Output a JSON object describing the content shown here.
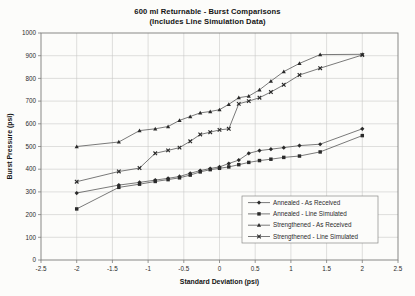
{
  "title": "600 ml Returnable - Burst Comparisons",
  "subtitle": "(Includes Line Simulation Data)",
  "chart_data": {
    "type": "line",
    "title": "600 ml Returnable - Burst Comparisons",
    "subtitle": "(Includes Line Simulation Data)",
    "xlabel": "Standard Deviation (psi)",
    "ylabel": "Burst Pressure (psi)",
    "xlim": [
      -2.5,
      2.5
    ],
    "ylim": [
      0,
      1000
    ],
    "xstep": 0.5,
    "ystep": 100,
    "grid": true,
    "legend_position": "inside-lower-right",
    "xticks": [
      "-2.5",
      "-2",
      "-1.5",
      "-1",
      "-0.5",
      "0",
      "0.5",
      "1",
      "1.5",
      "2",
      "2.5"
    ],
    "yticks": [
      "0",
      "100",
      "200",
      "300",
      "400",
      "500",
      "600",
      "700",
      "800",
      "900",
      "1000"
    ],
    "x": [
      -2.0,
      -1.41,
      -1.12,
      -0.9,
      -0.72,
      -0.56,
      -0.41,
      -0.27,
      -0.13,
      0.0,
      0.13,
      0.27,
      0.41,
      0.56,
      0.72,
      0.9,
      1.12,
      1.41,
      2.0
    ],
    "series": [
      {
        "name": "Annealed - As Received",
        "marker": "diamond",
        "values": [
          295,
          330,
          342,
          352,
          360,
          368,
          382,
          394,
          403,
          410,
          425,
          440,
          470,
          482,
          488,
          495,
          504,
          510,
          578
        ]
      },
      {
        "name": "Annealed - Line Simulated",
        "marker": "square",
        "values": [
          225,
          320,
          334,
          346,
          354,
          362,
          374,
          388,
          398,
          404,
          410,
          420,
          430,
          438,
          444,
          452,
          458,
          476,
          548
        ]
      },
      {
        "name": "Strengthened - As Received",
        "marker": "triangle",
        "values": [
          500,
          520,
          570,
          578,
          588,
          615,
          632,
          648,
          654,
          662,
          686,
          715,
          722,
          750,
          788,
          830,
          866,
          905,
          906
        ]
      },
      {
        "name": "Strengthened - Line Simulated",
        "marker": "x",
        "values": [
          345,
          390,
          405,
          470,
          483,
          495,
          523,
          553,
          563,
          573,
          578,
          688,
          700,
          715,
          740,
          772,
          815,
          845,
          903
        ]
      }
    ],
    "colors": {
      "line": "#4d4d4d",
      "marker": "#2a2a2a",
      "grid": "#c7c7c5",
      "axis": "#7d7d7b",
      "text": "#2b2b2b",
      "legend_border": "#8a8a88",
      "background": "#fcfcfa"
    }
  }
}
